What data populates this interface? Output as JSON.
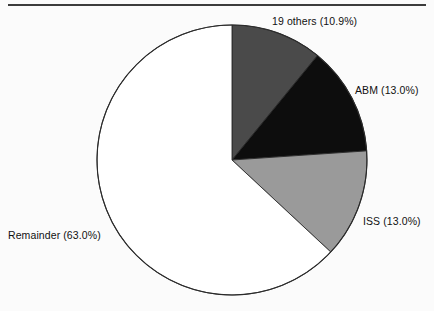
{
  "figure": {
    "background_color": "#fbfbfb",
    "rule_color": "#3c3c3c",
    "rule_label": "top-divider-rule"
  },
  "chart_data": {
    "type": "pie",
    "title": "",
    "subtitle": "",
    "xlabel": "",
    "ylabel": "",
    "legend_position": "none",
    "grid": false,
    "start_angle_deg": 0,
    "direction": "clockwise",
    "center": {
      "x": 232,
      "y": 160
    },
    "radius": 135,
    "categories": [
      "19 others",
      "ABM",
      "ISS",
      "Remainder"
    ],
    "values": [
      10.9,
      13.0,
      13.0,
      63.0
    ],
    "labels": [
      "19 others (10.9%)",
      "ABM (13.0%)",
      "ISS (13.0%)",
      "Remainder (63.0%)"
    ],
    "colors": [
      "#4a4a4a",
      "#0d0d0d",
      "#9a9a9a",
      "#ffffff"
    ],
    "edge_color": "#2b2b2b",
    "annotations": []
  },
  "slices": [
    {
      "name": "19 others",
      "percent": "10.9%",
      "label": "19 others (10.9%)",
      "color": "#4a4a4a"
    },
    {
      "name": "ABM",
      "percent": "13.0%",
      "label": "ABM (13.0%)",
      "color": "#0d0d0d"
    },
    {
      "name": "ISS",
      "percent": "13.0%",
      "label": "ISS (13.0%)",
      "color": "#9a9a9a"
    },
    {
      "name": "Remainder",
      "percent": "63.0%",
      "label": "Remainder (63.0%)",
      "color": "#ffffff"
    }
  ]
}
